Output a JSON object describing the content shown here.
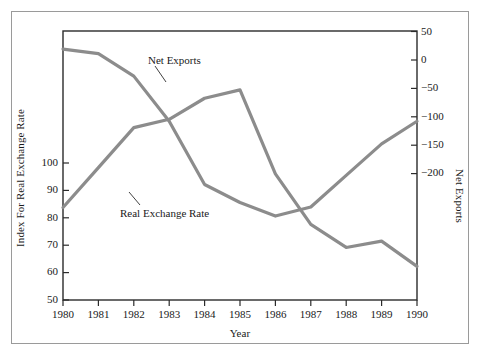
{
  "chart_data": {
    "type": "line",
    "title": "",
    "xlabel": "Year",
    "ylabel": "Index For Real Exchange Rate",
    "ylabel_right": "Net Exports",
    "grid": false,
    "legend_position": "inline-annotations",
    "x": [
      1980,
      1981,
      1982,
      1983,
      1984,
      1985,
      1986,
      1987,
      1988,
      1989,
      1990
    ],
    "categories": [
      "1980",
      "1981",
      "1982",
      "1983",
      "1984",
      "1985",
      "1986",
      "1987",
      "1988",
      "1989",
      "1990"
    ],
    "xtick_labels": [
      "1980",
      "1981",
      "1982",
      "1983",
      "1984",
      "1985",
      "1986",
      "1987",
      "1988",
      "1989",
      "1990"
    ],
    "ytick_labels_left": [
      "100",
      "90",
      "80",
      "70",
      "60",
      "50"
    ],
    "ytick_values_left": [
      100,
      90,
      80,
      70,
      60,
      50
    ],
    "ytick_labels_right": [
      "50",
      "0",
      "−50",
      "−100",
      "−150",
      "−200"
    ],
    "ytick_values_right": [
      50,
      0,
      -50,
      -100,
      -150,
      -200
    ],
    "ylim_left": [
      50,
      114
    ],
    "ylim_right": [
      -248,
      50
    ],
    "xlim": [
      1980,
      1990
    ],
    "series": [
      {
        "name": "Real Exchange Rate",
        "axis": "left",
        "color": "#8c8c8c",
        "values": [
          72,
          81.5,
          91,
          93,
          98,
          100,
          80,
          68,
          62.5,
          64,
          58
        ]
      },
      {
        "name": "Net Exports",
        "axis": "right",
        "color": "#8c8c8c",
        "values": [
          30,
          25,
          0,
          -50,
          -120,
          -140,
          -155,
          -145,
          -110,
          -75,
          -50
        ]
      }
    ],
    "annotations": [
      {
        "text": "Net Exports",
        "series": "Net Exports"
      },
      {
        "text": "Real Exchange Rate",
        "series": "Real Exchange Rate"
      }
    ]
  },
  "axes": {
    "x_title": "Year",
    "y_left_title": "Index For Real Exchange Rate",
    "y_right_title": "Net Exports"
  }
}
